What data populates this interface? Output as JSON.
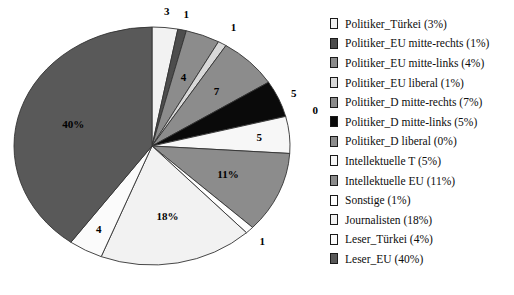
{
  "chart_data": {
    "type": "pie",
    "title": "",
    "subtitle": "",
    "xlabel": "",
    "ylabel": "",
    "grid": false,
    "legend_position": "right",
    "start_angle_deg": 0,
    "direction": "clockwise",
    "categories": [
      "Politiker_Türkei",
      "Politiker_EU mitte-rechts",
      "Politiker_EU mitte-links",
      "Politiker_EU liberal",
      "Politiker_D mitte-rechts",
      "Politiker_D mitte-links",
      "Politiker_D liberal",
      "Intellektuelle T",
      "Intellektuelle EU",
      "Sonstige",
      "Journalisten",
      "Leser_Türkei",
      "Leser_EU"
    ],
    "values": [
      3,
      1,
      4,
      1,
      7,
      5,
      0,
      5,
      11,
      1,
      18,
      4,
      40
    ],
    "unit": "%",
    "slice_labels": [
      "3",
      "1",
      "4",
      "1",
      "7",
      "5",
      "0",
      "5",
      "11%",
      "1",
      "18%",
      "4",
      "40%"
    ],
    "colors": [
      "#f2f2f2",
      "#4d4d4d",
      "#8c8c8c",
      "#d9d9d9",
      "#8c8c8c",
      "#0a0a0a",
      "#8c8c8c",
      "#f7f7f7",
      "#8c8c8c",
      "#ffffff",
      "#f2f2f2",
      "#fbfbfb",
      "#595959"
    ],
    "slice_border_color": "#333333"
  },
  "legend": {
    "items": [
      {
        "label": "Politiker_Türkei (3%)",
        "swatch": "#f2f2f2"
      },
      {
        "label": "Politiker_EU mitte-rechts (1%)",
        "swatch": "#4d4d4d"
      },
      {
        "label": "Politiker_EU mitte-links (4%)",
        "swatch": "#8c8c8c"
      },
      {
        "label": "Politiker_EU liberal (1%)",
        "swatch": "#d9d9d9"
      },
      {
        "label": "Politiker_D mitte-rechts (7%)",
        "swatch": "#8c8c8c"
      },
      {
        "label": "Politiker_D mitte-links (5%)",
        "swatch": "#0a0a0a"
      },
      {
        "label": "Politiker_D liberal (0%)",
        "swatch": "#8c8c8c"
      },
      {
        "label": "Intellektuelle T (5%)",
        "swatch": "#f7f7f7"
      },
      {
        "label": "Intellektuelle EU (11%)",
        "swatch": "#8c8c8c"
      },
      {
        "label": "Sonstige (1%)",
        "swatch": "#ffffff"
      },
      {
        "label": "Journalisten (18%)",
        "swatch": "#f2f2f2"
      },
      {
        "label": "Leser_Türkei (4%)",
        "swatch": "#fbfbfb"
      },
      {
        "label": "Leser_EU (40%)",
        "swatch": "#595959"
      }
    ]
  },
  "pie_geometry": {
    "cx": 152,
    "cy": 146,
    "rx": 138,
    "ry": 119,
    "label_radius_factor": 1.12
  }
}
